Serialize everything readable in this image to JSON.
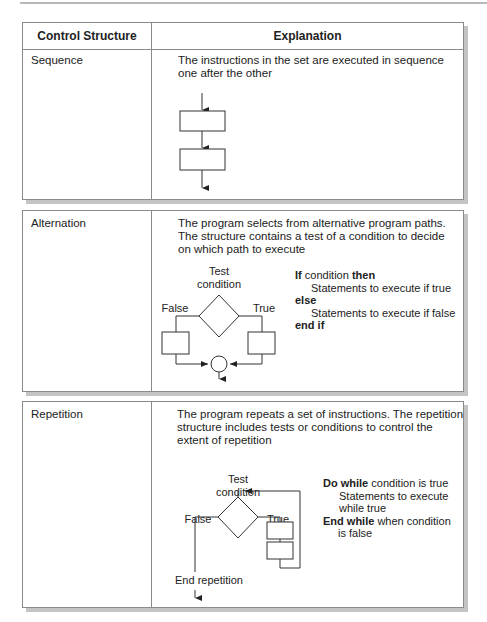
{
  "table": {
    "headers": [
      "Control Structure",
      "Explanation"
    ],
    "rows": [
      {
        "name": "Sequence",
        "explanation_lines": [
          "The instructions in the set are executed in sequence",
          "one after the other"
        ]
      },
      {
        "name": "Alternation",
        "explanation_lines": [
          "The program selects from alternative program paths.",
          "The structure contains a test of a condition to decide",
          "on which path to execute"
        ],
        "diagram": {
          "test_label_1": "Test",
          "test_label_2": "condition",
          "false_label": "False",
          "true_label": "True"
        },
        "pseudocode": {
          "kw_if": "If",
          "condition": " condition ",
          "kw_then": "then",
          "true_stmt": "Statements to execute if true",
          "kw_else": "else",
          "false_stmt": "Statements to execute if false",
          "kw_end_if": "end if"
        }
      },
      {
        "name": "Repetition",
        "explanation_lines": [
          "The program repeats a set of instructions.  The repetition",
          "structure includes tests or conditions to control the",
          "extent of repetition"
        ],
        "diagram": {
          "test_label_1": "Test",
          "test_label_2": "condition",
          "false_label": "False",
          "true_label": "True",
          "end_label": "End repetition"
        },
        "pseudocode": {
          "kw_do_while": "Do while",
          "do_while_rest": " condition is true",
          "stmt_1": "Statements to execute",
          "stmt_2": "while true",
          "kw_end_while": "End while",
          "end_while_rest": " when condition",
          "end_while_rest_2": "is false"
        }
      }
    ]
  }
}
